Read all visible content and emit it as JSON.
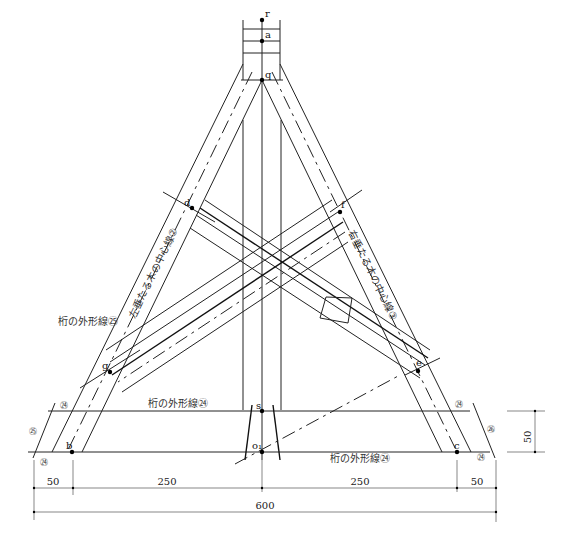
{
  "points": {
    "r": "r",
    "a": "a",
    "q": "q",
    "d": "d",
    "f": "f",
    "g": "g",
    "e": "e",
    "s": "s",
    "o1": "o₁",
    "b": "b",
    "c": "c"
  },
  "labels": {
    "left_rafter_centerline": "左垂たる木の中心線②",
    "right_rafter_centerline": "右垂たる木の中心線③",
    "beam_outline_25": "桁の外形線㉕",
    "beam_outline_24_upper": "桁の外形線㉔",
    "beam_outline_24_lower": "桁の外形線㉔"
  },
  "markers": {
    "c24_left_top": "㉔",
    "c25_left": "㉕",
    "c24_left_bottom": "㉔",
    "c24_right_top": "㉔",
    "c26_right": "㉖",
    "c24_right_bottom": "㉔"
  },
  "dimensions": {
    "left_50": "50",
    "left_250": "250",
    "right_250": "250",
    "right_50": "50",
    "total_600": "600",
    "vertical_50": "50"
  }
}
